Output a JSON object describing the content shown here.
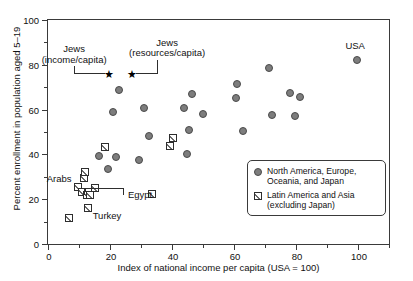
{
  "chart_data": {
    "type": "scatter",
    "title": "",
    "xlabel": "Index of national income per capita (USA = 100)",
    "ylabel": "Percent enrollment in population aged 5–19",
    "xlim": [
      0,
      110
    ],
    "ylim": [
      0,
      100
    ],
    "xticks": [
      0,
      20,
      40,
      60,
      80,
      100
    ],
    "yticks": [
      0,
      20,
      40,
      60,
      80,
      100
    ],
    "xtick_labels": [
      "0",
      "20",
      "40",
      "60",
      "80",
      "100"
    ],
    "ytick_labels": [
      "0",
      "20",
      "40",
      "60",
      "80",
      "100"
    ],
    "grid": false,
    "legend_position": "lower right",
    "series": [
      {
        "name": "North America, Europe, Oceania, and Japan",
        "marker": "circle",
        "color": "#7d7d7d",
        "points": [
          {
            "x": 16.5,
            "y": 39.3
          },
          {
            "x": 19.5,
            "y": 33.7
          },
          {
            "x": 21.0,
            "y": 59.0
          },
          {
            "x": 21.8,
            "y": 39.0
          },
          {
            "x": 23.0,
            "y": 68.7
          },
          {
            "x": 29.3,
            "y": 37.6
          },
          {
            "x": 31.0,
            "y": 60.8
          },
          {
            "x": 32.5,
            "y": 48.3
          },
          {
            "x": 44.0,
            "y": 60.8
          },
          {
            "x": 44.8,
            "y": 40.1
          },
          {
            "x": 45.6,
            "y": 50.9
          },
          {
            "x": 46.6,
            "y": 66.8
          },
          {
            "x": 50.0,
            "y": 58.0
          },
          {
            "x": 60.7,
            "y": 65.2
          },
          {
            "x": 60.9,
            "y": 71.5
          },
          {
            "x": 62.8,
            "y": 50.3
          },
          {
            "x": 71.3,
            "y": 78.7
          },
          {
            "x": 72.2,
            "y": 57.4
          },
          {
            "x": 78.2,
            "y": 67.2
          },
          {
            "x": 79.8,
            "y": 57.2
          },
          {
            "x": 81.3,
            "y": 65.5
          },
          {
            "x": 99.8,
            "y": 82.3
          }
        ]
      },
      {
        "name": "Latin America and Asia (excluding Japan)",
        "marker": "hatched-square",
        "color": "#ffffff",
        "points": [
          {
            "x": 6.7,
            "y": 11.7
          },
          {
            "x": 9.6,
            "y": 25.4
          },
          {
            "x": 11.0,
            "y": 23.0
          },
          {
            "x": 11.6,
            "y": 29.3
          },
          {
            "x": 12.0,
            "y": 32.0
          },
          {
            "x": 12.5,
            "y": 22.0
          },
          {
            "x": 12.8,
            "y": 16.2
          },
          {
            "x": 13.4,
            "y": 21.9
          },
          {
            "x": 15.2,
            "y": 24.8
          },
          {
            "x": 18.4,
            "y": 43.4
          },
          {
            "x": 33.4,
            "y": 22.3
          },
          {
            "x": 39.3,
            "y": 43.6
          },
          {
            "x": 40.4,
            "y": 47.2
          }
        ]
      },
      {
        "name": "Jews",
        "marker": "star",
        "color": "#000000",
        "points": [
          {
            "x": 19.4,
            "y": 75.8
          },
          {
            "x": 26.8,
            "y": 76.0
          }
        ]
      }
    ],
    "annotations": [
      {
        "id": "jews-income",
        "text": "Jews\n(income/capita)",
        "target_x": 19.4,
        "target_y": 75.8
      },
      {
        "id": "jews-resources",
        "text": "Jews\n(resources/capita)",
        "target_x": 26.8,
        "target_y": 76.0
      },
      {
        "id": "usa",
        "text": "USA",
        "target_x": 99.8,
        "target_y": 82.3
      },
      {
        "id": "arabs",
        "text": "Arabs",
        "target_x": 9.6,
        "target_y": 25.4
      },
      {
        "id": "egypt",
        "text": "Egypt",
        "target_x": 15.2,
        "target_y": 24.8
      },
      {
        "id": "turkey",
        "text": "Turkey",
        "target_x": 12.8,
        "target_y": 16.2
      }
    ]
  },
  "axes": {
    "x_title": "Index of national income per capita (USA = 100)",
    "y_title": "Percent enrollment in population aged 5–19",
    "x_ticks": [
      "0",
      "20",
      "40",
      "60",
      "80",
      "100"
    ],
    "y_ticks": [
      "0",
      "20",
      "40",
      "60",
      "80",
      "100"
    ]
  },
  "legend": {
    "items": [
      {
        "marker": "circle-marker",
        "line1": "North America, Europe,",
        "line2": "Oceania, and Japan"
      },
      {
        "marker": "hatched-square-marker",
        "line1": "Latin America and Asia",
        "line2": "(excluding Japan)"
      }
    ]
  },
  "labels": {
    "usa": "USA",
    "arabs": "Arabs",
    "egypt": "Egypt",
    "turkey": "Turkey",
    "jews_income_line1": "Jews",
    "jews_income_line2": "(income/capita)",
    "jews_resources_line1": "Jews",
    "jews_resources_line2": "(resources/capita)"
  },
  "colors": {
    "circle_fill": "#7d7d7d",
    "circle_stroke": "#4a4a4a",
    "square_fill": "#ffffff",
    "square_stroke": "#2e2e2e",
    "axis": "#3a3a3a",
    "text": "#111111"
  }
}
